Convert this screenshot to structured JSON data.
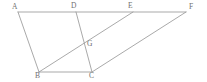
{
  "figure": {
    "canvas": {
      "width": 207,
      "height": 82,
      "background": "#ffffff"
    },
    "style": {
      "line_color": "#9a9a9a",
      "label_color": "#6f6f6f",
      "line_width": 0.85,
      "label_font_size": 7.5
    },
    "points": [
      {
        "id": "A",
        "label": "A",
        "x": 18,
        "y": 12,
        "label_x": 12,
        "label_y": 3
      },
      {
        "id": "D",
        "label": "D",
        "x": 76,
        "y": 12,
        "label_x": 71,
        "label_y": 2
      },
      {
        "id": "E",
        "label": "E",
        "x": 133,
        "y": 12,
        "label_x": 128,
        "label_y": 2
      },
      {
        "id": "F",
        "label": "F",
        "x": 186,
        "y": 12,
        "label_x": 189,
        "label_y": 3
      },
      {
        "id": "G",
        "label": "G",
        "x": 85,
        "y": 43,
        "label_x": 87,
        "label_y": 40
      },
      {
        "id": "B",
        "label": "B",
        "x": 39,
        "y": 72,
        "label_x": 35,
        "label_y": 72
      },
      {
        "id": "C",
        "label": "C",
        "x": 92,
        "y": 72,
        "label_x": 89,
        "label_y": 72
      }
    ],
    "segments": [
      {
        "id": "AF",
        "from": "A",
        "to": "F",
        "x1": 18,
        "y1": 12,
        "x2": 186,
        "y2": 12
      },
      {
        "id": "AB",
        "from": "A",
        "to": "B",
        "x1": 18,
        "y1": 12,
        "x2": 39,
        "y2": 72
      },
      {
        "id": "BC",
        "from": "B",
        "to": "C",
        "x1": 39,
        "y1": 72,
        "x2": 92,
        "y2": 72
      },
      {
        "id": "DC",
        "from": "D",
        "to": "C",
        "x1": 76,
        "y1": 12,
        "x2": 92,
        "y2": 72
      },
      {
        "id": "BE",
        "from": "B",
        "to": "E",
        "x1": 39,
        "y1": 72,
        "x2": 133,
        "y2": 12
      },
      {
        "id": "CF",
        "from": "C",
        "to": "F",
        "x1": 92,
        "y1": 72,
        "x2": 186,
        "y2": 12
      }
    ]
  }
}
